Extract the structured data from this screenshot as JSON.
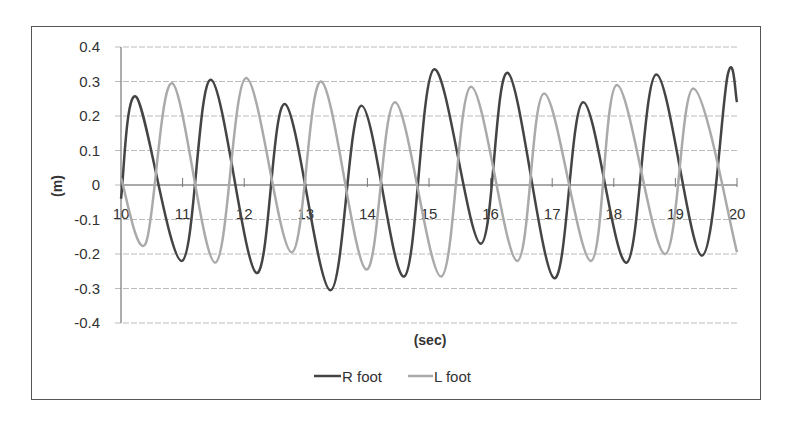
{
  "chart_data": {
    "type": "line",
    "title": "",
    "xlabel": "(sec)",
    "ylabel": "(m)",
    "xlim": [
      10,
      20
    ],
    "ylim": [
      -0.4,
      0.4
    ],
    "x_ticks": [
      "10",
      "11",
      "12",
      "13",
      "14",
      "15",
      "16",
      "17",
      "18",
      "19",
      "20"
    ],
    "y_ticks": [
      "0.4",
      "0.3",
      "0.2",
      "0.1",
      "0",
      "-0.1",
      "-0.2",
      "-0.3",
      "-0.4"
    ],
    "grid": "horizontal",
    "legend_position": "bottom",
    "series": [
      {
        "name": "R foot",
        "color": "#444444",
        "points": [
          [
            10.0,
            -0.04
          ],
          [
            10.25,
            0.255
          ],
          [
            10.99,
            -0.22
          ],
          [
            11.46,
            0.305
          ],
          [
            12.2,
            -0.255
          ],
          [
            12.66,
            0.235
          ],
          [
            13.4,
            -0.305
          ],
          [
            13.9,
            0.23
          ],
          [
            14.6,
            -0.265
          ],
          [
            15.08,
            0.335
          ],
          [
            15.84,
            -0.17
          ],
          [
            16.28,
            0.325
          ],
          [
            17.03,
            -0.27
          ],
          [
            17.5,
            0.24
          ],
          [
            18.21,
            -0.225
          ],
          [
            18.69,
            0.32
          ],
          [
            19.43,
            -0.205
          ],
          [
            19.85,
            0.32
          ],
          [
            20.0,
            0.24
          ]
        ]
      },
      {
        "name": "L foot",
        "color": "#aaaaaa",
        "points": [
          [
            10.0,
            0.02
          ],
          [
            10.4,
            -0.17
          ],
          [
            10.83,
            0.295
          ],
          [
            11.53,
            -0.225
          ],
          [
            12.03,
            0.31
          ],
          [
            12.77,
            -0.195
          ],
          [
            13.25,
            0.3
          ],
          [
            13.98,
            -0.245
          ],
          [
            14.45,
            0.24
          ],
          [
            15.2,
            -0.265
          ],
          [
            15.68,
            0.285
          ],
          [
            16.43,
            -0.22
          ],
          [
            16.87,
            0.265
          ],
          [
            17.63,
            -0.22
          ],
          [
            18.05,
            0.29
          ],
          [
            18.83,
            -0.2
          ],
          [
            19.29,
            0.28
          ],
          [
            20.0,
            -0.195
          ]
        ]
      }
    ]
  },
  "legend": {
    "items": [
      {
        "label": "R foot",
        "color": "#444444"
      },
      {
        "label": "L foot",
        "color": "#aaaaaa"
      }
    ]
  }
}
